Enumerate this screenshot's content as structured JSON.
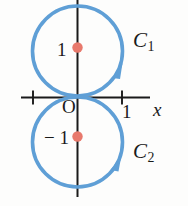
{
  "figure": {
    "background_color": "#fdfdfc",
    "curve_color": "#5f9fd6",
    "axis_color": "#1a1a1a",
    "point_color": "#e8796c"
  },
  "axes": {
    "x_axis_label": "x",
    "origin_label": "O",
    "x_ticks": [
      {
        "label": "",
        "value": -1
      },
      {
        "label": "1",
        "value": 1
      }
    ],
    "y_ticks": [
      {
        "label": "1",
        "value": 1
      },
      {
        "label": "− 1",
        "value": -1
      }
    ]
  },
  "curves": [
    {
      "name": "C_1",
      "label": "C",
      "subscript": "1",
      "center": [
        0,
        1
      ],
      "radius": 1,
      "orientation": "counterclockwise"
    },
    {
      "name": "C_2",
      "label": "C",
      "subscript": "2",
      "center": [
        0,
        -1
      ],
      "radius": 1,
      "orientation": "counterclockwise"
    }
  ],
  "points": [
    {
      "name": "center-upper",
      "coords": [
        0,
        1
      ]
    },
    {
      "name": "center-lower",
      "coords": [
        0,
        -1
      ]
    }
  ]
}
